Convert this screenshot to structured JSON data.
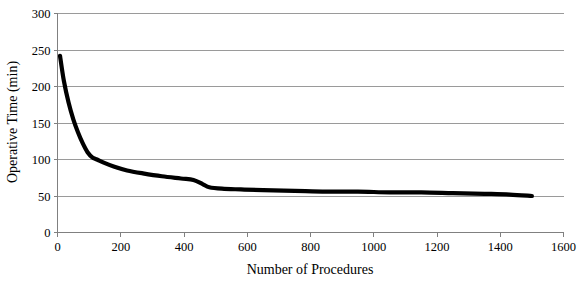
{
  "chart_data": {
    "type": "line",
    "title": "",
    "xlabel": "Number of Procedures",
    "ylabel": "Operative Time (min)",
    "xlim": [
      0,
      1600
    ],
    "ylim": [
      0,
      300
    ],
    "grid": "horizontal",
    "legend": "none",
    "x_ticks": [
      0,
      200,
      400,
      600,
      800,
      1000,
      1200,
      1400,
      1600
    ],
    "y_ticks": [
      0,
      50,
      100,
      150,
      200,
      250,
      300
    ],
    "x_tick_labels": [
      "0",
      "200",
      "400",
      "600",
      "800",
      "1000",
      "1200",
      "1400",
      "1600"
    ],
    "y_tick_labels": [
      "0",
      "50",
      "100",
      "150",
      "200",
      "250",
      "300"
    ],
    "line_color": "#000000",
    "gridline_color": "#9a9a9a",
    "series": [
      {
        "name": "Operative time learning curve",
        "x": [
          8,
          20,
          35,
          50,
          65,
          80,
          95,
          110,
          125,
          150,
          180,
          220,
          270,
          330,
          390,
          430,
          460,
          480,
          520,
          580,
          650,
          750,
          850,
          950,
          1050,
          1150,
          1250,
          1350,
          1430,
          1500
        ],
        "y": [
          242,
          208,
          178,
          155,
          137,
          122,
          110,
          103,
          100,
          95,
          90,
          85,
          81,
          77,
          74,
          72,
          66,
          62,
          60,
          59,
          58,
          57,
          56,
          56,
          55,
          55,
          54,
          53,
          52,
          50
        ]
      }
    ]
  }
}
